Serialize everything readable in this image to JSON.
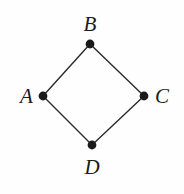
{
  "figure": {
    "kind": "undirected-graph",
    "background_color": "#fefefe",
    "stroke_color": "#2b2b2b",
    "vertex_fill_color": "#1a1a1a",
    "edge_width": 1.4,
    "vertex_radius": 4.4,
    "width": 184,
    "height": 194
  },
  "vertices": [
    {
      "id": "B",
      "label": "B",
      "cx": 90,
      "cy": 44,
      "label_position": "top"
    },
    {
      "id": "A",
      "label": "A",
      "cx": 43,
      "cy": 96,
      "label_position": "left"
    },
    {
      "id": "C",
      "label": "C",
      "cx": 144,
      "cy": 96,
      "label_position": "right"
    },
    {
      "id": "D",
      "label": "D",
      "cx": 92,
      "cy": 145,
      "label_position": "bottom"
    }
  ],
  "edges": [
    {
      "from": "A",
      "to": "B",
      "x1": 43,
      "y1": 96,
      "x2": 90,
      "y2": 44
    },
    {
      "from": "B",
      "to": "C",
      "x1": 90,
      "y1": 44,
      "x2": 144,
      "y2": 96
    },
    {
      "from": "C",
      "to": "D",
      "x1": 144,
      "y1": 96,
      "x2": 92,
      "y2": 145
    },
    {
      "from": "D",
      "to": "A",
      "x1": 92,
      "y1": 145,
      "x2": 43,
      "y2": 96
    }
  ]
}
